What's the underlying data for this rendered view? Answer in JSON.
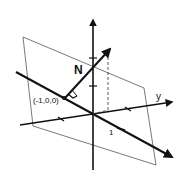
{
  "diagram": {
    "labels": {
      "normal": "N",
      "point": "(-1,0,0)",
      "y_axis": "y",
      "tick_one": "1"
    },
    "colors": {
      "stroke": "#111111",
      "plane": "#555555",
      "background": "#ffffff"
    }
  }
}
